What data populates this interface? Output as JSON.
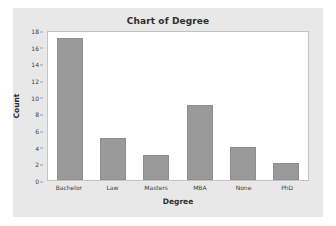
{
  "chart_data": {
    "type": "bar",
    "title": "Chart of Degree",
    "xlabel": "Degree",
    "ylabel": "Count",
    "categories": [
      "Bachelor",
      "Law",
      "Masters",
      "MBA",
      "None",
      "PhD"
    ],
    "values": [
      17,
      5,
      3,
      9,
      4,
      2
    ],
    "ylim": [
      0,
      18
    ],
    "yticks": [
      18,
      16,
      14,
      12,
      10,
      8,
      6,
      4,
      2,
      0
    ],
    "grid": false,
    "legend": null,
    "colors": {
      "bar_fill": "#9a9a9a",
      "bar_border": "#8d8d8d",
      "panel_background": "#e8e8e8",
      "plot_background": "#ffffff",
      "plot_border": "#c4c4c4",
      "text": "#2d2d2d"
    }
  }
}
